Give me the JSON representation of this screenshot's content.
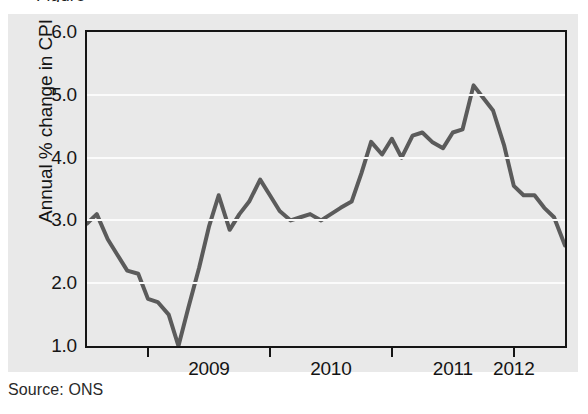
{
  "caption_fragment": "Figure",
  "source_note": "Source: ONS",
  "chart_data": {
    "type": "line",
    "title": "",
    "xlabel": "",
    "ylabel": "Annual % change in CPI",
    "ylim": [
      1.0,
      6.0
    ],
    "xlim": [
      2008.5,
      2012.42
    ],
    "grid": true,
    "legend": "none",
    "line_color": "#5b5b5b",
    "plot_background": "#e9e9e9",
    "gridline_color": "#fbfbfb",
    "frame_color": "#151515",
    "y_ticks": [
      1.0,
      2.0,
      3.0,
      4.0,
      5.0,
      6.0
    ],
    "y_tick_labels": [
      "1.0",
      "2.0",
      "3.0",
      "4.0",
      "5.0",
      "6.0"
    ],
    "gridline_values": [
      2.0,
      3.0,
      4.0,
      5.0
    ],
    "x_tick_positions": [
      2009.0,
      2010.0,
      2011.0,
      2012.0
    ],
    "x_category_labels": [
      "2009",
      "2010",
      "2011",
      "2012"
    ],
    "x_label_positions": [
      2009.5,
      2010.5,
      2011.5,
      2012.0
    ],
    "series": [
      {
        "name": "Annual % change in CPI",
        "x": [
          2008.5,
          2008.58,
          2008.67,
          2008.75,
          2008.83,
          2008.92,
          2009.0,
          2009.08,
          2009.17,
          2009.25,
          2009.33,
          2009.42,
          2009.5,
          2009.58,
          2009.67,
          2009.75,
          2009.83,
          2009.92,
          2010.0,
          2010.08,
          2010.17,
          2010.25,
          2010.33,
          2010.42,
          2010.5,
          2010.58,
          2010.67,
          2010.75,
          2010.83,
          2010.92,
          2011.0,
          2011.08,
          2011.17,
          2011.25,
          2011.33,
          2011.42,
          2011.5,
          2011.58,
          2011.67,
          2011.75,
          2011.83,
          2011.92,
          2012.0,
          2012.08,
          2012.17,
          2012.25,
          2012.33,
          2012.42
        ],
        "values": [
          2.95,
          3.1,
          2.7,
          2.45,
          2.2,
          2.15,
          1.75,
          1.7,
          1.5,
          1.0,
          1.6,
          2.25,
          2.9,
          3.4,
          2.85,
          3.1,
          3.3,
          3.65,
          3.4,
          3.15,
          3.0,
          3.05,
          3.1,
          3.0,
          3.1,
          3.2,
          3.3,
          3.75,
          4.25,
          4.05,
          4.3,
          4.0,
          4.35,
          4.4,
          4.25,
          4.15,
          4.4,
          4.45,
          5.15,
          4.95,
          4.75,
          4.2,
          3.55,
          3.4,
          3.4,
          3.2,
          3.05,
          2.6
        ]
      }
    ]
  }
}
